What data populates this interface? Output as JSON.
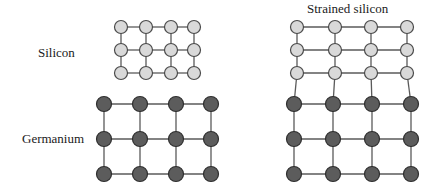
{
  "figure": {
    "type": "diagram"
  },
  "labels": {
    "silicon": "Silicon",
    "germanium": "Germanium",
    "strained_silicon": "Strained silicon"
  },
  "colors": {
    "silicon_fill": "#d9d9d9",
    "silicon_stroke": "#4a4a4a",
    "germanium_fill": "#5c5c5c",
    "germanium_stroke": "#2e2e2e",
    "bond": "#5a5a5a",
    "background": "#ffffff",
    "text": "#1a1a1a"
  },
  "geometry": {
    "silicon_radius": 6.5,
    "germanium_radius": 7.5,
    "bond_width": 1.3
  },
  "lattices": {
    "relaxed_silicon": {
      "name": "relaxed-silicon-lattice",
      "atom": "Si",
      "rows": 3,
      "cols": 4,
      "columns_x": [
        121,
        146,
        171,
        194
      ],
      "rows_y": [
        27,
        50,
        73
      ],
      "note": "unstrained silicon, smaller lattice constant"
    },
    "relaxed_germanium": {
      "name": "relaxed-germanium-lattice",
      "atom": "Ge",
      "rows": 3,
      "cols": 4,
      "columns_x": [
        104,
        140,
        176,
        211
      ],
      "rows_y": [
        104,
        139,
        174
      ],
      "note": "unstrained germanium, larger lattice constant"
    },
    "strained_silicon": {
      "name": "strained-silicon-lattice",
      "atom": "Si",
      "rows": 3,
      "cols": 4,
      "columns_x": [
        297,
        335,
        371,
        407
      ],
      "columns_x_top": [
        297,
        335,
        371,
        407
      ],
      "rows_y": [
        27,
        50,
        73
      ],
      "note": "silicon stretched to match germanium spacing"
    },
    "strained_germanium": {
      "name": "strained-substrate-germanium-lattice",
      "atom": "Ge",
      "rows": 3,
      "cols": 4,
      "columns_x": [
        294,
        333,
        372,
        411
      ],
      "rows_y": [
        104,
        139,
        174
      ],
      "note": "germanium substrate underneath strained silicon"
    }
  },
  "interface_bonds": {
    "name": "silicon-germanium-interface",
    "pairs": [
      {
        "from_x": 297,
        "from_y": 73,
        "to_x": 294,
        "to_y": 104
      },
      {
        "from_x": 335,
        "from_y": 73,
        "to_x": 333,
        "to_y": 104
      },
      {
        "from_x": 371,
        "from_y": 73,
        "to_x": 372,
        "to_y": 104
      },
      {
        "from_x": 407,
        "from_y": 73,
        "to_x": 411,
        "to_y": 104
      }
    ]
  }
}
